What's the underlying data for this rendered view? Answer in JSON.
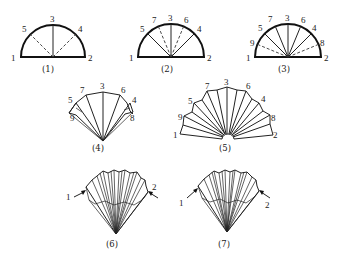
{
  "figure": {
    "panels": [
      {
        "id": "p1",
        "caption": "(1)",
        "labels": [
          "1",
          "2",
          "3",
          "4",
          "5"
        ]
      },
      {
        "id": "p2",
        "caption": "(2)",
        "labels": [
          "1",
          "2",
          "3",
          "4",
          "5",
          "6",
          "7"
        ]
      },
      {
        "id": "p3",
        "caption": "(3)",
        "labels": [
          "1",
          "2",
          "3",
          "4",
          "5",
          "6",
          "7",
          "8",
          "9"
        ]
      },
      {
        "id": "p4",
        "caption": "(4)",
        "labels": [
          "3",
          "4",
          "5",
          "6",
          "7",
          "8",
          "9"
        ]
      },
      {
        "id": "p5",
        "caption": "(5)",
        "labels": [
          "1",
          "2",
          "3",
          "4",
          "5",
          "6",
          "7",
          "8",
          "9"
        ]
      },
      {
        "id": "p6",
        "caption": "(6)",
        "labels": [
          "1",
          "2"
        ]
      },
      {
        "id": "p7",
        "caption": "(7)",
        "labels": [
          "1",
          "2"
        ]
      }
    ]
  },
  "p1": {
    "caption": "(1)",
    "l1": "1",
    "l2": "2",
    "l3": "3",
    "l4": "4",
    "l5": "5"
  },
  "p2": {
    "caption": "(2)",
    "l1": "1",
    "l2": "2",
    "l3": "3",
    "l4": "4",
    "l5": "5",
    "l6": "6",
    "l7": "7"
  },
  "p3": {
    "caption": "(3)",
    "l1": "1",
    "l2": "2",
    "l3": "3",
    "l4": "4",
    "l5": "5",
    "l6": "6",
    "l7": "7",
    "l8": "8",
    "l9": "9"
  },
  "p4": {
    "caption": "(4)",
    "l3": "3",
    "l4": "4",
    "l5": "5",
    "l6": "6",
    "l7": "7",
    "l8": "8",
    "l9": "9"
  },
  "p5": {
    "caption": "(5)",
    "l1": "1",
    "l2": "2",
    "l3": "3",
    "l4": "4",
    "l5": "5",
    "l6": "6",
    "l7": "7",
    "l8": "8",
    "l9": "9"
  },
  "p6": {
    "caption": "(6)",
    "l1": "1",
    "l2": "2"
  },
  "p7": {
    "caption": "(7)",
    "l1": "1",
    "l2": "2"
  }
}
